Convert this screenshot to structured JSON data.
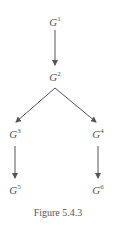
{
  "diagram": {
    "nodes": [
      {
        "id": "G1",
        "base": "G",
        "sup": "1",
        "x": 55,
        "y": 16
      },
      {
        "id": "G2",
        "base": "G",
        "sup": "2",
        "x": 55,
        "y": 71
      },
      {
        "id": "G3",
        "base": "G",
        "sup": "3",
        "x": 15,
        "y": 128
      },
      {
        "id": "G4",
        "base": "G",
        "sup": "4",
        "x": 98,
        "y": 128
      },
      {
        "id": "G5",
        "base": "G",
        "sup": "5",
        "x": 15,
        "y": 184
      },
      {
        "id": "G6",
        "base": "G",
        "sup": "6",
        "x": 98,
        "y": 184
      }
    ],
    "edges": [
      {
        "from": "G1",
        "to": "G2"
      },
      {
        "from": "G2",
        "to": "G3"
      },
      {
        "from": "G2",
        "to": "G4"
      },
      {
        "from": "G3",
        "to": "G5"
      },
      {
        "from": "G4",
        "to": "G6"
      }
    ],
    "caption": "Figure 5.4.3",
    "line_color": "#555555"
  }
}
